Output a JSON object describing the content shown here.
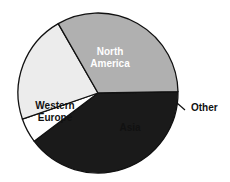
{
  "chart_data": {
    "type": "pie",
    "title": "",
    "categories": [
      "North America",
      "Other",
      "Asia",
      "Western Europe"
    ],
    "values": [
      40,
      5,
      22,
      33
    ],
    "unit": "percent (estimated from slice angles)",
    "start_angle_deg": -1,
    "direction": "clockwise",
    "colors": [
      "#1a1a1a",
      "#ffffff",
      "#ececec",
      "#b0b0b0"
    ],
    "label_colors": [
      "#ffffff",
      "#111111",
      "#111111",
      "#111111"
    ],
    "labels": [
      {
        "lines": [
          "North",
          "America"
        ],
        "x": 110,
        "y": 55
      },
      {
        "lines": [
          "Other"
        ],
        "x": 191,
        "y": 111,
        "outside": true
      },
      {
        "lines": [
          "Asia"
        ],
        "x": 130,
        "y": 131
      },
      {
        "lines": [
          "Western",
          "Europe"
        ],
        "x": 55,
        "y": 109
      }
    ],
    "legend": null,
    "grid": false
  },
  "geometry": {
    "cx": 98,
    "cy": 93,
    "r": 80,
    "stroke": "#111111",
    "stroke_width": 1.3,
    "leader_line": {
      "x1": 177,
      "y1": 103,
      "x2": 185,
      "y2": 110
    }
  }
}
